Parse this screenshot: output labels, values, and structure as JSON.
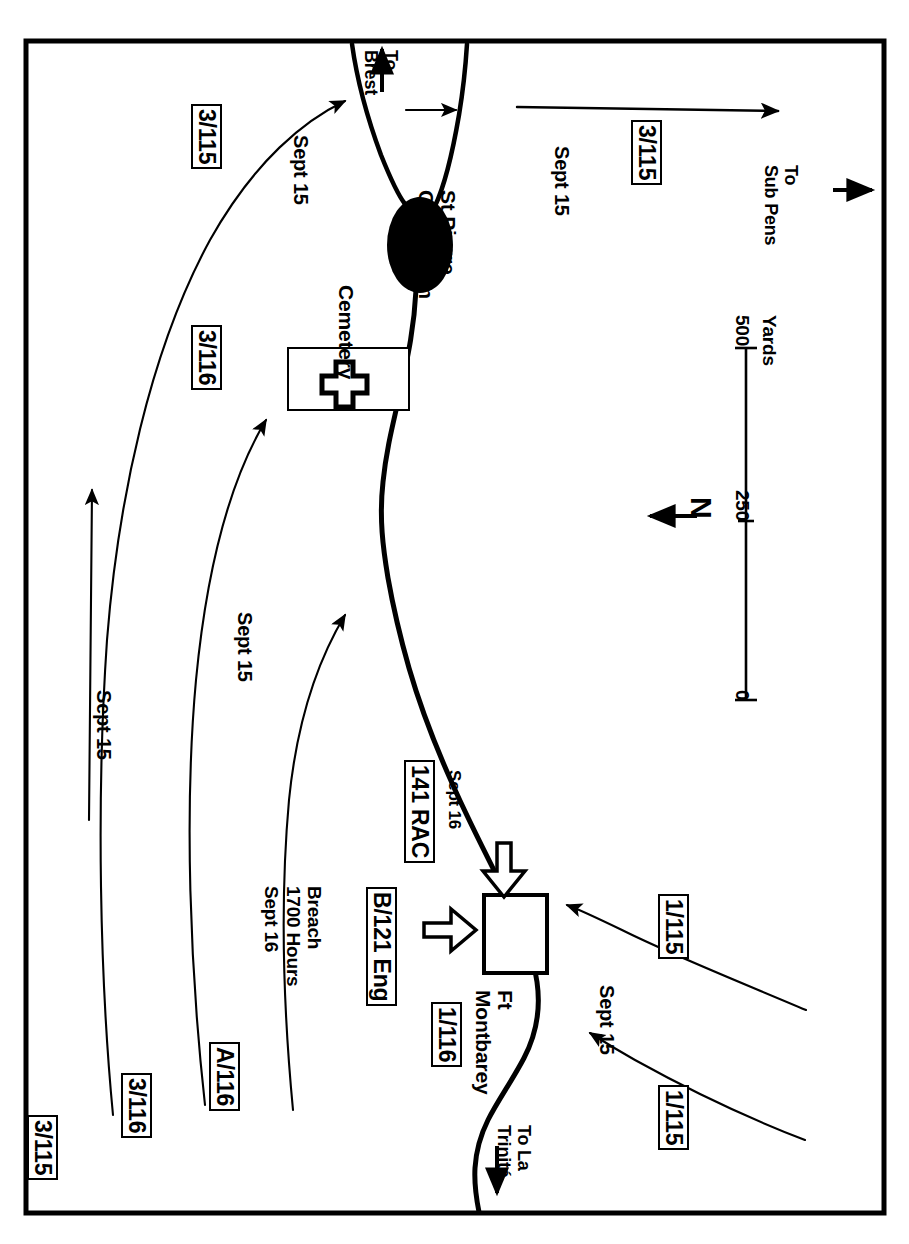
{
  "map": {
    "title": "Assault on Fort Montbarey / St Pierre Quilbignon, Brest",
    "border_color": "#000000",
    "background_color": "#ffffff",
    "line_color": "#000000",
    "orientation_note": "All map text is printed rotated 90 degrees clockwise",
    "north_arrow_label": "N",
    "scale": {
      "ticks": [
        "0",
        "250",
        "500"
      ],
      "unit_label": "Yards"
    },
    "places": [
      {
        "id": "cemetery",
        "label": "Cemetery",
        "symbol": "cross-in-rectangle"
      },
      {
        "id": "st-pierre-quilbignon",
        "label": "St Pierre\nQuilbignon",
        "symbol": "filled-ellipse"
      },
      {
        "id": "ft-montbarey",
        "label": "Ft\nMontbarey",
        "symbol": "open-rectangle"
      }
    ],
    "road_directions": [
      {
        "id": "to-brest",
        "label": "To\nBrest",
        "arrow": "up-arrow"
      },
      {
        "id": "to-sub-pens",
        "label": "To\nSub Pens",
        "arrow": "right-arrow"
      },
      {
        "id": "to-la-trinite",
        "label": "To La\nTrinité",
        "arrow": "down-arrow"
      }
    ],
    "units": [
      {
        "id": "unit-3-115-top",
        "label": "3/115"
      },
      {
        "id": "unit-3-116-top",
        "label": "3/116"
      },
      {
        "id": "unit-3-115-left",
        "label": "3/115"
      },
      {
        "id": "unit-3-116-left",
        "label": "3/116"
      },
      {
        "id": "unit-a-116",
        "label": "A/116"
      },
      {
        "id": "unit-3-115-right",
        "label": "3/115"
      },
      {
        "id": "unit-141-rac",
        "label": "141 RAC"
      },
      {
        "id": "unit-b-121-eng",
        "label": "B/121 Eng"
      },
      {
        "id": "unit-1-116",
        "label": "1/116"
      },
      {
        "id": "unit-1-115-upper",
        "label": "1/115"
      },
      {
        "id": "unit-1-115-lower",
        "label": "1/115"
      }
    ],
    "date_labels": [
      {
        "id": "date-sept15-a",
        "label": "Sept 15"
      },
      {
        "id": "date-sept15-b",
        "label": "Sept 15"
      },
      {
        "id": "date-sept15-c",
        "label": "Sept 15"
      },
      {
        "id": "date-sept15-d",
        "label": "Sept 15"
      },
      {
        "id": "date-sept15-e",
        "label": "Sept 15"
      },
      {
        "id": "date-sept16-rac",
        "label": "Sept 16"
      }
    ],
    "annotations": [
      {
        "id": "breach-note",
        "label": "Breach\n1700 Hours\nSept 16"
      }
    ]
  }
}
